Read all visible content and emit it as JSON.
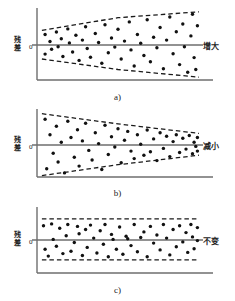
{
  "figure": {
    "background": "#ffffff",
    "ink": "#222222",
    "axis_color": "#6e6e6e",
    "point_color": "#111111",
    "band_color": "#1a1a1a"
  },
  "panels": [
    {
      "id": "panel-a",
      "caption": "a)",
      "ylabel": "残差",
      "zero_label": "0",
      "side_label": "增大",
      "pattern": "fan-out",
      "chart": {
        "type": "scatter",
        "title": "a)",
        "ylabel": "残差",
        "xlabel": "",
        "annotation": "增大",
        "zero_line": 0,
        "xlim": [
          0,
          1
        ],
        "ylim": [
          -1,
          1
        ],
        "grid": false,
        "band_upper": [
          [
            0.03,
            0.42
          ],
          [
            0.5,
            0.78
          ],
          [
            1.0,
            0.95
          ]
        ],
        "band_lower": [
          [
            0.03,
            -0.4
          ],
          [
            0.5,
            -0.7
          ],
          [
            1.0,
            -0.92
          ]
        ],
        "points": [
          [
            0.05,
            0.3
          ],
          [
            0.05,
            -0.26
          ],
          [
            0.08,
            0.1
          ],
          [
            0.09,
            -0.12
          ],
          [
            0.12,
            0.37
          ],
          [
            0.13,
            -0.05
          ],
          [
            0.15,
            0.18
          ],
          [
            0.16,
            -0.33
          ],
          [
            0.19,
            0.46
          ],
          [
            0.2,
            0.06
          ],
          [
            0.22,
            -0.2
          ],
          [
            0.24,
            0.28
          ],
          [
            0.26,
            -0.44
          ],
          [
            0.28,
            0.14
          ],
          [
            0.3,
            0.52
          ],
          [
            0.31,
            -0.1
          ],
          [
            0.33,
            -0.35
          ],
          [
            0.36,
            0.33
          ],
          [
            0.38,
            0.07
          ],
          [
            0.4,
            -0.52
          ],
          [
            0.42,
            0.58
          ],
          [
            0.44,
            -0.22
          ],
          [
            0.46,
            0.2
          ],
          [
            0.48,
            -0.06
          ],
          [
            0.5,
            0.45
          ],
          [
            0.52,
            -0.4
          ],
          [
            0.54,
            0.11
          ],
          [
            0.57,
            0.66
          ],
          [
            0.58,
            -0.14
          ],
          [
            0.6,
            -0.6
          ],
          [
            0.62,
            0.3
          ],
          [
            0.64,
            0.05
          ],
          [
            0.66,
            -0.3
          ],
          [
            0.68,
            0.72
          ],
          [
            0.7,
            -0.48
          ],
          [
            0.72,
            0.22
          ],
          [
            0.74,
            -0.08
          ],
          [
            0.76,
            0.5
          ],
          [
            0.78,
            -0.68
          ],
          [
            0.8,
            0.14
          ],
          [
            0.82,
            0.8
          ],
          [
            0.84,
            -0.25
          ],
          [
            0.86,
            0.38
          ],
          [
            0.88,
            -0.56
          ],
          [
            0.9,
            0.6
          ],
          [
            0.91,
            -0.05
          ],
          [
            0.93,
            -0.78
          ],
          [
            0.95,
            0.26
          ],
          [
            0.96,
            0.88
          ],
          [
            0.97,
            -0.36
          ],
          [
            0.98,
            -0.7
          ],
          [
            0.99,
            0.55
          ]
        ]
      }
    },
    {
      "id": "panel-b",
      "caption": "b)",
      "ylabel": "残差",
      "zero_label": "0",
      "side_label": "减小",
      "pattern": "fan-in",
      "chart": {
        "type": "scatter",
        "title": "b)",
        "ylabel": "残差",
        "xlabel": "",
        "annotation": "减小",
        "zero_line": 0,
        "xlim": [
          0,
          1
        ],
        "ylim": [
          -1,
          1
        ],
        "grid": false,
        "band_upper": [
          [
            0.03,
            0.92
          ],
          [
            0.5,
            0.62
          ],
          [
            1.0,
            0.34
          ]
        ],
        "band_lower": [
          [
            0.03,
            -0.9
          ],
          [
            0.5,
            -0.58
          ],
          [
            1.0,
            -0.3
          ]
        ],
        "points": [
          [
            0.05,
            0.76
          ],
          [
            0.06,
            -0.7
          ],
          [
            0.08,
            0.3
          ],
          [
            0.1,
            -0.24
          ],
          [
            0.12,
            0.55
          ],
          [
            0.13,
            -0.5
          ],
          [
            0.15,
            0.08
          ],
          [
            0.17,
            -0.82
          ],
          [
            0.19,
            0.7
          ],
          [
            0.21,
            0.22
          ],
          [
            0.23,
            -0.36
          ],
          [
            0.25,
            0.45
          ],
          [
            0.26,
            -0.62
          ],
          [
            0.28,
            0.12
          ],
          [
            0.3,
            0.64
          ],
          [
            0.32,
            -0.16
          ],
          [
            0.34,
            -0.44
          ],
          [
            0.36,
            0.36
          ],
          [
            0.38,
            0.04
          ],
          [
            0.4,
            -0.72
          ],
          [
            0.42,
            0.58
          ],
          [
            0.44,
            -0.28
          ],
          [
            0.46,
            0.24
          ],
          [
            0.48,
            -0.06
          ],
          [
            0.5,
            0.48
          ],
          [
            0.52,
            -0.52
          ],
          [
            0.54,
            0.14
          ],
          [
            0.56,
            0.4
          ],
          [
            0.58,
            -0.18
          ],
          [
            0.6,
            -0.4
          ],
          [
            0.62,
            0.3
          ],
          [
            0.64,
            0.02
          ],
          [
            0.66,
            -0.3
          ],
          [
            0.68,
            0.44
          ],
          [
            0.7,
            -0.2
          ],
          [
            0.72,
            0.18
          ],
          [
            0.74,
            -0.46
          ],
          [
            0.76,
            0.36
          ],
          [
            0.78,
            -0.1
          ],
          [
            0.8,
            0.26
          ],
          [
            0.82,
            -0.34
          ],
          [
            0.84,
            0.1
          ],
          [
            0.86,
            0.3
          ],
          [
            0.88,
            -0.22
          ],
          [
            0.9,
            0.2
          ],
          [
            0.92,
            -0.12
          ],
          [
            0.94,
            0.28
          ],
          [
            0.96,
            -0.26
          ],
          [
            0.97,
            0.08
          ],
          [
            0.98,
            -0.04
          ],
          [
            0.99,
            0.22
          ],
          [
            0.99,
            -0.18
          ]
        ]
      }
    },
    {
      "id": "panel-c",
      "caption": "c)",
      "ylabel": "残差",
      "zero_label": "0",
      "side_label": "不变",
      "pattern": "constant",
      "chart": {
        "type": "scatter",
        "title": "c)",
        "ylabel": "残差",
        "xlabel": "",
        "annotation": "不变",
        "zero_line": 0,
        "xlim": [
          0,
          1
        ],
        "ylim": [
          -1,
          1
        ],
        "grid": false,
        "band_upper": [
          [
            0.03,
            0.68
          ],
          [
            0.5,
            0.68
          ],
          [
            1.0,
            0.68
          ]
        ],
        "band_lower": [
          [
            0.03,
            -0.64
          ],
          [
            0.5,
            -0.64
          ],
          [
            1.0,
            -0.64
          ]
        ],
        "points": [
          [
            0.04,
            0.46
          ],
          [
            0.05,
            -0.3
          ],
          [
            0.07,
            -0.52
          ],
          [
            0.09,
            0.52
          ],
          [
            0.1,
            0.02
          ],
          [
            0.12,
            -0.2
          ],
          [
            0.14,
            0.38
          ],
          [
            0.16,
            -0.44
          ],
          [
            0.18,
            0.14
          ],
          [
            0.19,
            0.5
          ],
          [
            0.21,
            -0.36
          ],
          [
            0.23,
            -0.08
          ],
          [
            0.25,
            0.44
          ],
          [
            0.26,
            0.2
          ],
          [
            0.28,
            -0.5
          ],
          [
            0.3,
            0.34
          ],
          [
            0.31,
            -0.24
          ],
          [
            0.33,
            0.48
          ],
          [
            0.35,
            0.06
          ],
          [
            0.37,
            -0.42
          ],
          [
            0.39,
            0.3
          ],
          [
            0.41,
            -0.14
          ],
          [
            0.42,
            0.5
          ],
          [
            0.44,
            -0.54
          ],
          [
            0.46,
            0.18
          ],
          [
            0.47,
            0.02
          ],
          [
            0.49,
            -0.3
          ],
          [
            0.51,
            0.42
          ],
          [
            0.53,
            -0.46
          ],
          [
            0.55,
            0.12
          ],
          [
            0.56,
            0.04
          ],
          [
            0.58,
            -0.18
          ],
          [
            0.6,
            0.5
          ],
          [
            0.62,
            -0.38
          ],
          [
            0.64,
            0.08
          ],
          [
            0.66,
            0.26
          ],
          [
            0.68,
            -0.54
          ],
          [
            0.7,
            0.44
          ],
          [
            0.72,
            -0.1
          ],
          [
            0.74,
            0.16
          ],
          [
            0.76,
            -0.32
          ],
          [
            0.78,
            0.5
          ],
          [
            0.8,
            0.06
          ],
          [
            0.82,
            -0.48
          ],
          [
            0.84,
            0.34
          ],
          [
            0.86,
            -0.22
          ],
          [
            0.88,
            0.46
          ],
          [
            0.9,
            -0.06
          ],
          [
            0.92,
            0.24
          ],
          [
            0.93,
            -0.4
          ],
          [
            0.95,
            0.5
          ],
          [
            0.96,
            0.1
          ],
          [
            0.97,
            -0.28
          ],
          [
            0.99,
            0.4
          ],
          [
            0.99,
            -0.02
          ]
        ]
      }
    }
  ]
}
